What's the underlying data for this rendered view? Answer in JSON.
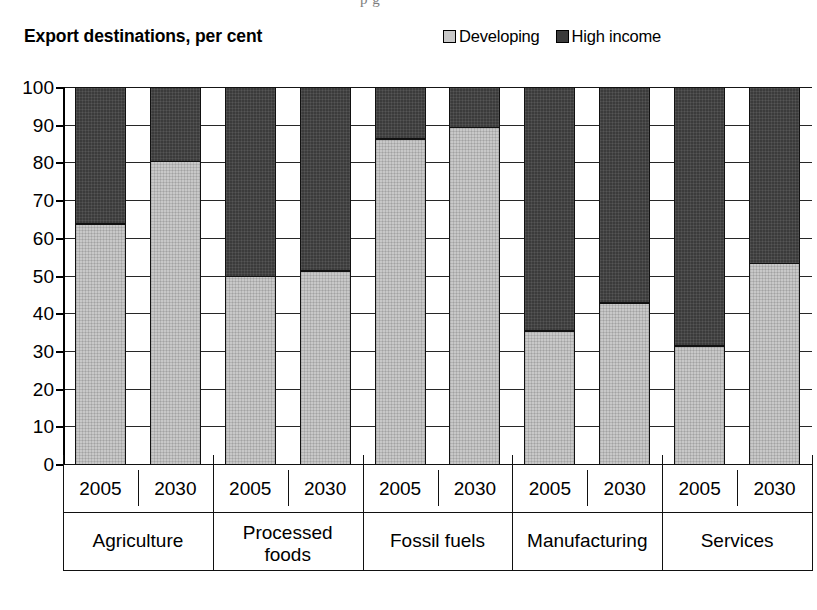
{
  "page": {
    "remnant_text": "p  g"
  },
  "header": {
    "title": "Export destinations, per cent"
  },
  "legend": {
    "position": "top-right",
    "items": [
      {
        "label": "Developing",
        "color": "#c8c8c8",
        "swatch": "developing"
      },
      {
        "label": "High income",
        "color": "#3b3b3b",
        "swatch": "high"
      }
    ]
  },
  "chart_data": {
    "type": "bar",
    "subtype": "stacked-100",
    "title": "Export destinations, per cent",
    "xlabel": "",
    "ylabel": "",
    "ylim": [
      0,
      100
    ],
    "yticks": [
      0,
      10,
      20,
      30,
      40,
      50,
      60,
      70,
      80,
      90,
      100
    ],
    "grid": true,
    "legend_position": "top-right",
    "groups": [
      "Agriculture",
      "Processed foods",
      "Fossil fuels",
      "Manufacturing",
      "Services"
    ],
    "categories": [
      "Agriculture 2005",
      "Agriculture 2030",
      "Processed foods 2005",
      "Processed foods 2030",
      "Fossil fuels 2005",
      "Fossil fuels 2030",
      "Manufacturing 2005",
      "Manufacturing 2030",
      "Services 2005",
      "Services 2030"
    ],
    "years": [
      "2005",
      "2030",
      "2005",
      "2030",
      "2005",
      "2030",
      "2005",
      "2030",
      "2005",
      "2030"
    ],
    "series": [
      {
        "name": "Developing",
        "color": "#c8c8c8",
        "values": [
          64,
          80.5,
          50,
          51.5,
          86.5,
          89.5,
          35.5,
          43,
          31.5,
          53.5
        ]
      },
      {
        "name": "High income",
        "color": "#3b3b3b",
        "values": [
          36,
          19.5,
          50,
          48.5,
          13.5,
          10.5,
          64.5,
          57,
          68.5,
          46.5
        ]
      }
    ]
  }
}
